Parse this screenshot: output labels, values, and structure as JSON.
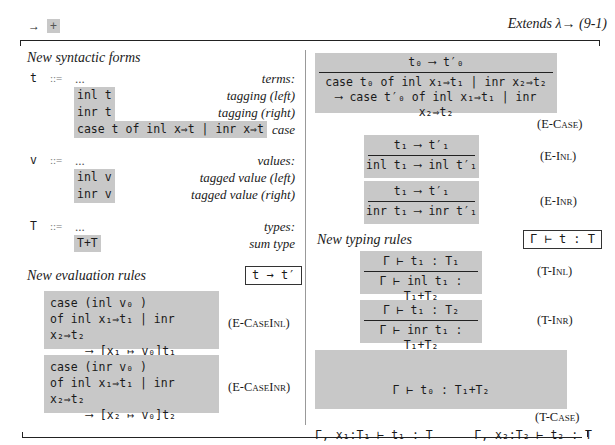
{
  "header": {
    "left_arrow": "→",
    "left_plus": "+",
    "right_text": "Extends λ→ (9-1)"
  },
  "syntax": {
    "title": "New syntactic forms",
    "groups": [
      {
        "symbol": "t",
        "def": "::=",
        "ellipsis": "...",
        "category": "terms:",
        "forms": [
          {
            "form": "inl t",
            "desc": "tagging (left)"
          },
          {
            "form": "inr t",
            "desc": "tagging (right)"
          },
          {
            "form": "case t of inl x⇒t | inr x⇒t",
            "desc": "case"
          }
        ]
      },
      {
        "symbol": "v",
        "def": "::=",
        "ellipsis": "...",
        "category": "values:",
        "forms": [
          {
            "form": "inl v",
            "desc": "tagged value (left)"
          },
          {
            "form": "inr v",
            "desc": "tagged value (right)"
          }
        ]
      },
      {
        "symbol": "T",
        "def": "::=",
        "ellipsis": "...",
        "category": "types:",
        "forms": [
          {
            "form": "T+T",
            "desc": "sum type"
          }
        ]
      }
    ]
  },
  "evaluation": {
    "title": "New evaluation rules",
    "judgment": "t → t′",
    "rules": [
      {
        "name": "(E-CaseInl)",
        "lines": [
          "case (inl v₀ )",
          "of inl x₁⇒t₁ | inr x₂⇒t₂",
          "⟶ [x₁ ↦ v₀]t₁"
        ]
      },
      {
        "name": "(E-CaseInr)",
        "lines": [
          "case (inr v₀ )",
          "of inl x₁⇒t₁ | inr x₂⇒t₂",
          "⟶ [x₂ ↦ v₀]t₂"
        ]
      },
      {
        "name": "(E-Case)",
        "premise": "t₀ ⟶ t′₀",
        "conclusion": [
          "case t₀ of inl x₁⇒t₁ | inr x₂⇒t₂",
          "⟶ case t′₀ of inl x₁⇒t₁ | inr x₂⇒t₂"
        ]
      },
      {
        "name": "(E-Inl)",
        "premise": "t₁ ⟶ t′₁",
        "conclusion": [
          "inl t₁ ⟶ inl t′₁"
        ]
      },
      {
        "name": "(E-Inr)",
        "premise": "t₁ ⟶ t′₁",
        "conclusion": [
          "inr t₁ ⟶ inr t′₁"
        ]
      }
    ]
  },
  "typing": {
    "title": "New typing rules",
    "judgment": "Γ ⊢ t : T",
    "rules": [
      {
        "name": "(T-Inl)",
        "premise": "Γ ⊢ t₁ : T₁",
        "conclusion": "Γ ⊢ inl t₁ : T₁+T₂"
      },
      {
        "name": "(T-Inr)",
        "premise": "Γ ⊢ t₁ : T₂",
        "conclusion": "Γ ⊢ inr t₁ : T₁+T₂"
      },
      {
        "name": "(T-Case)",
        "premises": [
          "Γ ⊢ t₀ : T₁+T₂",
          "Γ, x₁:T₁ ⊢ t₁ : T      Γ, x₂:T₂ ⊢ t₂ : T"
        ],
        "conclusion": "Γ ⊢ case t₀ of inl x₁⇒t₁ | inr x₂⇒t₂ : T"
      }
    ]
  }
}
